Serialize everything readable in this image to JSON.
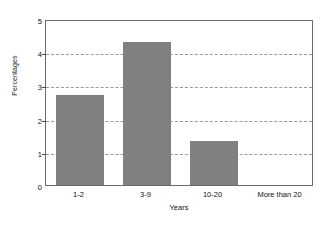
{
  "chart_data": {
    "type": "bar",
    "title": "",
    "subtitle": "",
    "xlabel": "Years",
    "ylabel": "Percentages",
    "categories": [
      "1-2",
      "3-9",
      "10-20",
      "More than 20"
    ],
    "values": [
      2.7,
      4.3,
      1.33,
      0
    ],
    "ylim": [
      0,
      5
    ],
    "yticks": [
      0,
      1,
      2,
      3,
      4,
      5
    ],
    "ytick_labels": [
      "0",
      "1",
      "2",
      "3",
      "4",
      "5"
    ],
    "grid": true,
    "grid_style": "dashed",
    "grid_axis": "y",
    "legend": false,
    "legend_position": "none",
    "series": [
      {
        "name": "Percentages",
        "values": [
          2.7,
          4.3,
          1.33,
          0
        ]
      }
    ],
    "colors": {
      "bar": "#808080",
      "grid": "#9a9a9a",
      "axis": "#6b6b6b",
      "text": "#111111",
      "background": "#ffffff"
    }
  }
}
